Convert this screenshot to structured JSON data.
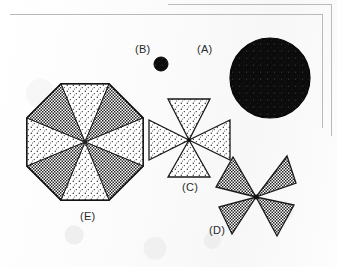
{
  "figure": {
    "background_color": "#fdfdfd",
    "frame_color": "#b9b9bb",
    "ink_color": "#1a1a1a"
  },
  "labels": {
    "a": "(A)",
    "b": "(B)",
    "c": "(C)",
    "d": "(D)",
    "e": "(E)"
  },
  "shapes": [
    {
      "id": "a",
      "label": "(A)",
      "kind": "circle",
      "fill": "solid-black",
      "center_x": 270,
      "center_y": 78,
      "radius": 40,
      "sectors": 0
    },
    {
      "id": "b",
      "label": "(B)",
      "kind": "circle",
      "fill": "solid-black",
      "center_x": 161,
      "center_y": 64,
      "radius": 7,
      "sectors": 0
    },
    {
      "id": "c",
      "label": "(C)",
      "kind": "cross-of-triangles",
      "fill": "light-stipple",
      "center_x": 189,
      "center_y": 140,
      "radius": 42,
      "sectors": 4,
      "orientation_deg": 0
    },
    {
      "id": "d",
      "label": "(D)",
      "kind": "cross-of-triangles",
      "fill": "dark-checker",
      "center_x": 256,
      "center_y": 197,
      "radius": 44,
      "sectors": 4,
      "orientation_deg": 45
    },
    {
      "id": "e",
      "label": "(E)",
      "kind": "octagon-sectors",
      "fill": "alternating-dark-light",
      "center_x": 85,
      "center_y": 142,
      "radius": 63,
      "sectors": 8
    }
  ],
  "label_positions": {
    "a": {
      "x": 197,
      "y": 43
    },
    "b": {
      "x": 135,
      "y": 43
    },
    "c": {
      "x": 182,
      "y": 181
    },
    "d": {
      "x": 209,
      "y": 224
    },
    "e": {
      "x": 80,
      "y": 210
    }
  },
  "frames": [
    {
      "name": "outer-page-edge",
      "top": 4,
      "left": 168,
      "right": 332,
      "bottom": 136
    },
    {
      "name": "inner-page-edge",
      "top": 14,
      "left": 10,
      "right": 323,
      "bottom": 128
    }
  ]
}
